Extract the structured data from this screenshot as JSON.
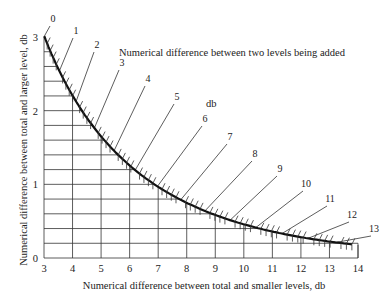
{
  "chart_data": {
    "type": "line",
    "title": "",
    "annotation": "Numerical difference between two levels being added",
    "annotation_unit": "db",
    "xlabel": "Numerical difference between total and smaller levels, db",
    "ylabel": "Numerical difference between total and larger level, db",
    "xlim": [
      3,
      14
    ],
    "ylim": [
      0,
      3
    ],
    "x_ticks": [
      3,
      4,
      5,
      6,
      7,
      8,
      9,
      10,
      11,
      12,
      13,
      14
    ],
    "y_ticks": [
      0,
      1,
      2,
      3
    ],
    "grid": true,
    "curve_labels": [
      "0",
      "1",
      "2",
      "3",
      "4",
      "5",
      "6",
      "7",
      "8",
      "9",
      "10",
      "11",
      "12",
      "13"
    ],
    "series": [
      {
        "name": "addition curve",
        "level_difference": [
          0,
          1,
          2,
          3,
          4,
          5,
          6,
          7,
          8,
          9,
          10,
          11,
          12,
          13
        ],
        "x": [
          3.01,
          3.54,
          4.12,
          4.76,
          5.46,
          6.19,
          6.97,
          7.79,
          8.64,
          9.51,
          10.41,
          11.33,
          12.27,
          13.21
        ],
        "y": [
          3.01,
          2.54,
          2.12,
          1.76,
          1.46,
          1.19,
          0.97,
          0.79,
          0.64,
          0.51,
          0.41,
          0.33,
          0.27,
          0.21
        ]
      }
    ]
  }
}
